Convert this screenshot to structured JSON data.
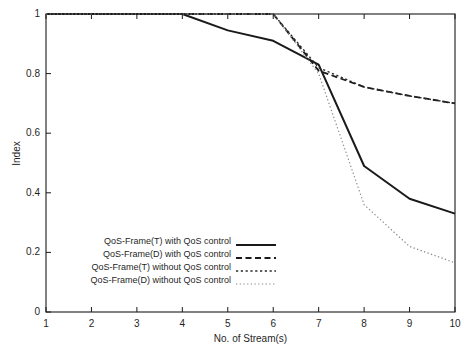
{
  "chart_data": {
    "type": "line",
    "title": "",
    "xlabel": "No. of Stream(s)",
    "ylabel": "Index",
    "xlim": [
      1,
      10
    ],
    "ylim": [
      0,
      1
    ],
    "grid": false,
    "legend_position": "lower-left",
    "xticks": [
      "1",
      "2",
      "3",
      "4",
      "5",
      "6",
      "7",
      "8",
      "9",
      "10"
    ],
    "yticks": [
      "0",
      "0.2",
      "0.4",
      "0.6",
      "0.8",
      "1"
    ],
    "xtick_values": [
      1,
      2,
      3,
      4,
      5,
      6,
      7,
      8,
      9,
      10
    ],
    "ytick_values": [
      0,
      0.2,
      0.4,
      0.6,
      0.8,
      1
    ],
    "x": [
      1,
      2,
      3,
      4,
      5,
      6,
      7,
      8,
      9,
      10
    ],
    "series": [
      {
        "name": "QoS-Frame(T) with QoS control",
        "style": "solid",
        "color": "#1a1a1a",
        "width": 2.0,
        "values": [
          1.0,
          1.0,
          1.0,
          1.0,
          0.945,
          0.91,
          0.83,
          0.49,
          0.38,
          0.33
        ]
      },
      {
        "name": "QoS-Frame(D) with QoS control",
        "style": "dashed",
        "color": "#1a1a1a",
        "width": 1.8,
        "values": [
          1.0,
          1.0,
          1.0,
          1.0,
          1.0,
          1.0,
          0.81,
          0.755,
          0.725,
          0.7
        ]
      },
      {
        "name": "QoS-Frame(T) without QoS control",
        "style": "dotted",
        "color": "#2a2a2a",
        "width": 1.4,
        "values": [
          1.0,
          1.0,
          1.0,
          1.0,
          1.0,
          1.0,
          0.82,
          0.755,
          0.725,
          0.7
        ]
      },
      {
        "name": "QoS-Frame(D) without QoS control",
        "style": "fine-dotted",
        "color": "#8a8a8a",
        "width": 1.2,
        "values": [
          1.0,
          1.0,
          1.0,
          1.0,
          1.0,
          1.0,
          0.8,
          0.36,
          0.22,
          0.165
        ]
      }
    ]
  },
  "axes": {
    "ylabel": "Index",
    "xlabel": "No. of Stream(s)"
  },
  "legend": {
    "entries": [
      {
        "label": "QoS-Frame(T) with QoS control"
      },
      {
        "label": "QoS-Frame(D) with QoS control"
      },
      {
        "label": "QoS-Frame(T) without QoS control"
      },
      {
        "label": "QoS-Frame(D) without QoS control"
      }
    ]
  },
  "colors": {
    "axis": "#1a1a1a",
    "background": "#ffffff",
    "series_dark": "#1a1a1a",
    "series_light": "#8a8a8a"
  }
}
